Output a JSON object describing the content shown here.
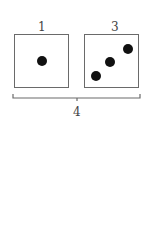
{
  "diagram": {
    "groups": [
      {
        "label": "1",
        "dots": 1
      },
      {
        "label": "3",
        "dots": 3
      }
    ],
    "total_label": "4",
    "colors": {
      "box_border": "#6a6a6a",
      "dot": "#111111",
      "text": "#444444"
    }
  }
}
